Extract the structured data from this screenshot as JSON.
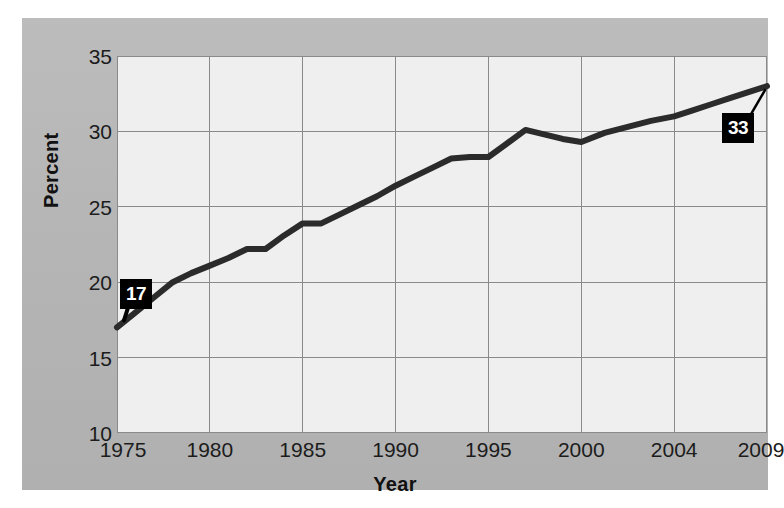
{
  "chart_data": {
    "type": "line",
    "title": "",
    "xlabel": "Year",
    "ylabel": "Percent",
    "xlim": [
      1975,
      2009
    ],
    "ylim": [
      10,
      35
    ],
    "grid": true,
    "legend": null,
    "x_tick_labels": [
      "1975",
      "1980",
      "1985",
      "1990",
      "1995",
      "2000",
      "2004",
      "2009"
    ],
    "x_tick_values": [
      1975,
      1980,
      1985,
      1990,
      1995,
      2000,
      2004,
      2009
    ],
    "y_tick_labels": [
      "10",
      "15",
      "20",
      "25",
      "30",
      "35"
    ],
    "y_tick_values": [
      10,
      15,
      20,
      25,
      30,
      35
    ],
    "series": [
      {
        "name": "Percent",
        "color": "#2b2b2b",
        "x": [
          1975,
          1976,
          1977,
          1978,
          1979,
          1980,
          1981,
          1982,
          1983,
          1984,
          1985,
          1986,
          1987,
          1988,
          1989,
          1990,
          1991,
          1992,
          1993,
          1994,
          1995,
          1996,
          1997,
          1998,
          1999,
          2000,
          2001,
          2002,
          2003,
          2004,
          2005,
          2006,
          2007,
          2008,
          2009
        ],
        "values": [
          17.0,
          18.0,
          19.0,
          20.0,
          20.6,
          21.1,
          21.6,
          22.2,
          22.2,
          23.1,
          23.9,
          23.9,
          24.5,
          25.1,
          25.7,
          26.4,
          27.0,
          27.6,
          28.2,
          28.3,
          28.3,
          29.2,
          30.1,
          29.8,
          29.5,
          29.3,
          29.9,
          30.3,
          30.7,
          31.0,
          31.4,
          31.8,
          32.2,
          32.6,
          33.0
        ]
      }
    ],
    "annotations": [
      {
        "id": "start-value",
        "text": "17",
        "x": 1975,
        "y": 17.0,
        "style": "black-box-white-text",
        "leader": "down-left"
      },
      {
        "id": "end-value",
        "text": "33",
        "x": 2009,
        "y": 33.0,
        "style": "black-box-white-text",
        "leader": "up-right"
      }
    ]
  },
  "figure": {
    "background_color": "#ffffff",
    "panel_color": "#b6b6b6",
    "plot_background_color": "#efefef",
    "grid_color": "#8a8a8a",
    "line_color": "#2b2b2b"
  }
}
